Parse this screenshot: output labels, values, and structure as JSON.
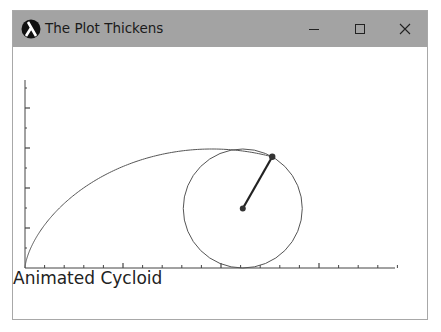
{
  "window": {
    "title": "The Plot Thickens",
    "app_icon": "lambda-icon",
    "controls": {
      "minimize": "minimize-icon",
      "maximize": "maximize-icon",
      "close": "close-icon"
    },
    "titlebar_color": "#a3a3a3"
  },
  "plot": {
    "caption": "Animated Cycloid",
    "x_axis": {
      "major_ticks": 4,
      "minor_per_major": 5
    },
    "y_axis": {
      "major_ticks": 4,
      "minor_per_major": 2
    },
    "cycloid_radius_px": 59.5,
    "rolling_angle_rad": 3.66,
    "curve_color": "#555555",
    "spoke_color": "#222222"
  }
}
